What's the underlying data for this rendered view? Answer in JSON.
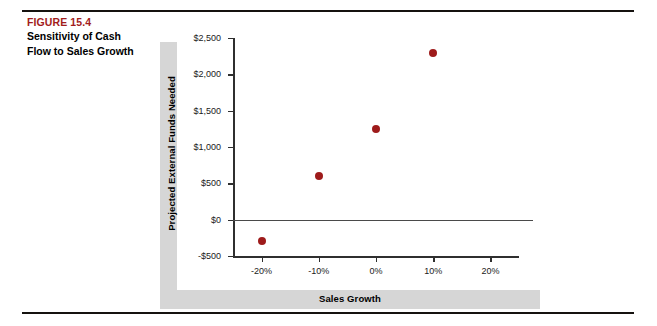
{
  "caption": {
    "figure_number": "FIGURE 15.4",
    "title_line1": "Sensitivity of Cash",
    "title_line2": "Flow to Sales Growth",
    "figure_number_color": "#a21c1c"
  },
  "chart_data": {
    "type": "scatter",
    "title": "",
    "xlabel": "Sales Growth",
    "ylabel": "Projected External Funds Needed",
    "x": [
      -20,
      -10,
      0,
      10
    ],
    "values": [
      -300,
      600,
      1250,
      2300
    ],
    "points": [
      {
        "x": "-20%",
        "y": -300
      },
      {
        "x": "-10%",
        "y": 600
      },
      {
        "x": "0%",
        "y": 1250
      },
      {
        "x": "10%",
        "y": 2300
      }
    ],
    "xlim": [
      -25,
      25
    ],
    "ylim": [
      -500,
      2500
    ],
    "x_tick_labels": [
      "-20%",
      "-10%",
      "0%",
      "10%",
      "20%"
    ],
    "x_tick_values": [
      -20,
      -10,
      0,
      10,
      20
    ],
    "y_tick_labels": [
      "$2,500",
      "$2,000",
      "$1,500",
      "$1,000",
      "$500",
      "$0",
      "-$500"
    ],
    "y_tick_values": [
      2500,
      2000,
      1500,
      1000,
      500,
      0,
      -500
    ],
    "grid": false,
    "legend": "none",
    "marker_color": "#9e1b1b",
    "zero_reference_line": 0
  }
}
